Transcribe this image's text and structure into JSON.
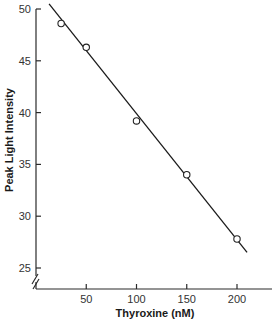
{
  "chart_data": {
    "type": "scatter",
    "title": "",
    "xlabel": "Thyroxine (nM)",
    "ylabel": "Peak Light Intensity",
    "x_ticks": [
      50,
      100,
      150,
      200
    ],
    "y_ticks": [
      25,
      30,
      35,
      40,
      45,
      50
    ],
    "xlim": [
      0,
      235
    ],
    "ylim": [
      23,
      50.5
    ],
    "y_axis_break": true,
    "grid": false,
    "legend": null,
    "series": [
      {
        "name": "Measured",
        "marker": "open-circle",
        "points": [
          {
            "x": 25,
            "y": 48.6
          },
          {
            "x": 50,
            "y": 46.3
          },
          {
            "x": 100,
            "y": 39.2
          },
          {
            "x": 150,
            "y": 34.0
          },
          {
            "x": 200,
            "y": 27.8
          }
        ]
      },
      {
        "name": "Linear fit",
        "style": "line",
        "points": [
          {
            "x": 13,
            "y": 50.5
          },
          {
            "x": 210,
            "y": 26.5
          }
        ]
      }
    ],
    "colors": {
      "axis": "#2a2a2a",
      "line": "#1a1a1a",
      "marker_fill": "#ffffff",
      "marker_edge": "#222222"
    }
  }
}
